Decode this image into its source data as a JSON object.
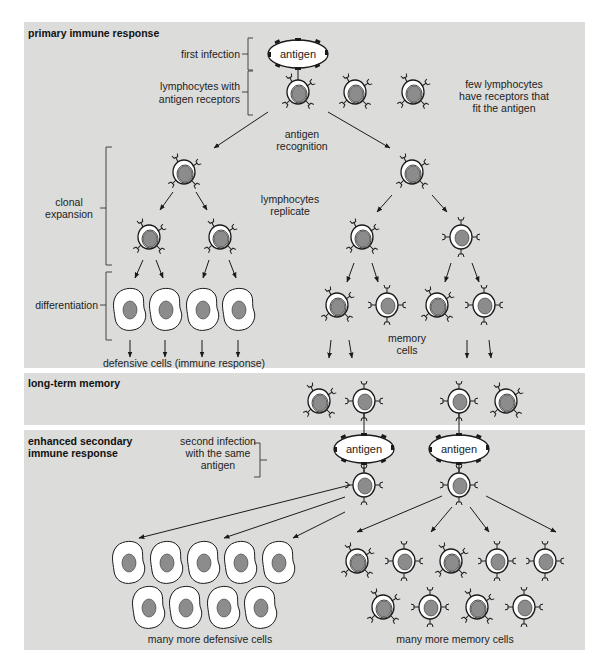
{
  "panels": [
    {
      "id": "primary",
      "title": "primary immune response",
      "labels": {
        "first_infection": "first infection",
        "lymphocytes_with_receptors_1": "lymphocytes with",
        "lymphocytes_with_receptors_2": "antigen receptors",
        "few_lymphocytes_1": "few lymphocytes",
        "few_lymphocytes_2": "have receptors that",
        "few_lymphocytes_3": "fit the antigen",
        "antigen_recognition_1": "antigen",
        "antigen_recognition_2": "recognition",
        "lymphocytes_replicate_1": "lymphocytes",
        "lymphocytes_replicate_2": "replicate",
        "clonal_expansion_1": "clonal",
        "clonal_expansion_2": "expansion",
        "differentiation": "differentiation",
        "defensive_cells": "defensive cells (immune response)",
        "memory_cells_1": "memory",
        "memory_cells_2": "cells",
        "antigen": "antigen"
      }
    },
    {
      "id": "memory",
      "title": "long-term memory"
    },
    {
      "id": "secondary",
      "title_1": "enhanced secondary",
      "title_2": "immune response",
      "labels": {
        "second_infection_1": "second infection",
        "second_infection_2": "with the same",
        "second_infection_3": "antigen",
        "antigen_left": "antigen",
        "antigen_right": "antigen",
        "many_defensive": "many more defensive cells",
        "many_memory": "many more memory cells"
      }
    }
  ],
  "colors": {
    "panel_bg": "#dcdcda",
    "nucleus": "#8c8c8c",
    "cell_fill": "#ffffff",
    "outline": "#1a1a1a"
  }
}
